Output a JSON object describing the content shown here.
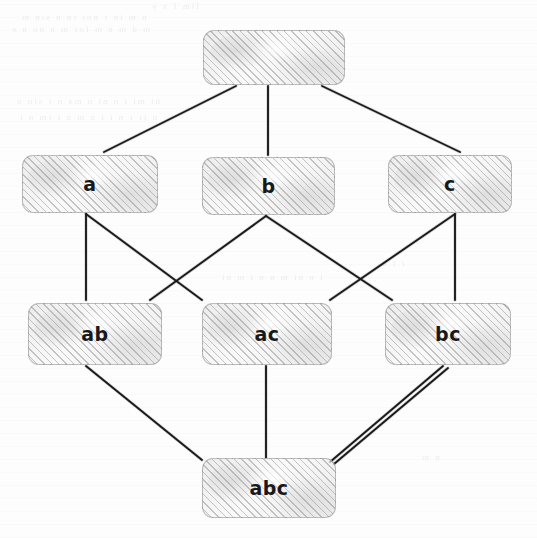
{
  "diagram": {
    "style": "hand-drawn hatched rounded rectangles on scanned white paper",
    "background_color": "#fdfdfd",
    "node_fill_color": "#ededed",
    "node_hatch_color": "#787878",
    "node_border_color": "#8c8c8c",
    "edge_color": "#1a1a1a",
    "label_color": "#18181a",
    "levels": 4
  },
  "nodes": [
    {
      "id": "empty",
      "label": "",
      "level": 0,
      "x": 203,
      "y": 30,
      "w": 142,
      "h": 55
    },
    {
      "id": "a",
      "label": "a",
      "level": 1,
      "x": 22,
      "y": 155,
      "w": 136,
      "h": 58
    },
    {
      "id": "b",
      "label": "b",
      "level": 1,
      "x": 202,
      "y": 157,
      "w": 133,
      "h": 58
    },
    {
      "id": "c",
      "label": "c",
      "level": 1,
      "x": 388,
      "y": 155,
      "w": 124,
      "h": 58
    },
    {
      "id": "ab",
      "label": "ab",
      "level": 2,
      "x": 28,
      "y": 303,
      "w": 134,
      "h": 62
    },
    {
      "id": "ac",
      "label": "ac",
      "level": 2,
      "x": 202,
      "y": 303,
      "w": 130,
      "h": 62
    },
    {
      "id": "bc",
      "label": "bc",
      "level": 2,
      "x": 385,
      "y": 303,
      "w": 126,
      "h": 62
    },
    {
      "id": "abc",
      "label": "abc",
      "level": 3,
      "x": 202,
      "y": 458,
      "w": 134,
      "h": 60
    }
  ],
  "edges": [
    {
      "from": "empty",
      "to": "a",
      "x1": 236,
      "y1": 86,
      "x2": 104,
      "y2": 152
    },
    {
      "from": "empty",
      "to": "b",
      "x1": 268,
      "y1": 86,
      "x2": 268,
      "y2": 155
    },
    {
      "from": "empty",
      "to": "c",
      "x1": 322,
      "y1": 86,
      "x2": 460,
      "y2": 152
    },
    {
      "from": "a",
      "to": "ab",
      "x1": 86,
      "y1": 214,
      "x2": 86,
      "y2": 300
    },
    {
      "from": "a",
      "to": "ac",
      "x1": 86,
      "y1": 214,
      "x2": 202,
      "y2": 300
    },
    {
      "from": "b",
      "to": "ab",
      "x1": 266,
      "y1": 216,
      "x2": 150,
      "y2": 300
    },
    {
      "from": "b",
      "to": "bc",
      "x1": 266,
      "y1": 216,
      "x2": 392,
      "y2": 300
    },
    {
      "from": "c",
      "to": "ac",
      "x1": 455,
      "y1": 214,
      "x2": 330,
      "y2": 300
    },
    {
      "from": "c",
      "to": "bc",
      "x1": 455,
      "y1": 214,
      "x2": 455,
      "y2": 300
    },
    {
      "from": "ab",
      "to": "abc",
      "x1": 86,
      "y1": 366,
      "x2": 202,
      "y2": 460
    },
    {
      "from": "ac",
      "to": "abc",
      "x1": 266,
      "y1": 366,
      "x2": 266,
      "y2": 458
    },
    {
      "from": "bc",
      "to": "abc",
      "x1": 443,
      "y1": 366,
      "x2": 330,
      "y2": 462
    },
    {
      "from": "bc",
      "to": "abc",
      "x1": 448,
      "y1": 368,
      "x2": 334,
      "y2": 464
    }
  ],
  "bleed_text": {
    "note": "faint mirrored show-through of printing on the reverse of the page",
    "lines": [
      {
        "text": "lim  f  x  y",
        "x": 150,
        "y": 1,
        "size": 9
      },
      {
        "text": "n   m     in    r  not    rn      n   sin      m",
        "x": 20,
        "y": 12,
        "size": 9
      },
      {
        "text": "m   d   m    n   m   for   m  n   no    n        e",
        "x": 10,
        "y": 24,
        "size": 9
      },
      {
        "text": "nt   mi   t  n   nt        n ma   n   r  sin  u",
        "x": 15,
        "y": 96,
        "size": 9
      },
      {
        "text": "n    tr    r  n   t    t n   m   n    t  rm  n  t",
        "x": 18,
        "y": 112,
        "size": 9
      },
      {
        "text": "t  n    nt      m  n    n  t  m   nt",
        "x": 220,
        "y": 272,
        "size": 9
      },
      {
        "text": "r t n",
        "x": 380,
        "y": 258,
        "size": 9
      },
      {
        "text": "n  m",
        "x": 420,
        "y": 452,
        "size": 9
      }
    ]
  }
}
